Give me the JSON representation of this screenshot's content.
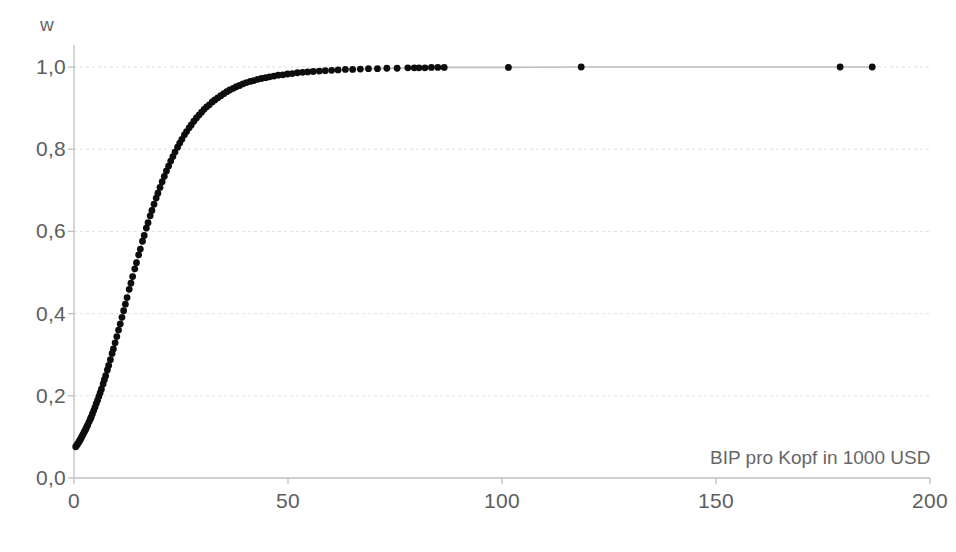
{
  "chart_data": {
    "type": "scatter",
    "title": "",
    "subtitle": "",
    "xlabel": "BIP pro Kopf in 1000 USD",
    "ylabel": "w",
    "xlim": [
      0,
      200
    ],
    "ylim": [
      0,
      1.05
    ],
    "xticks": [
      0,
      50,
      100,
      150,
      200
    ],
    "xtick_labels": [
      "0",
      "50",
      "100",
      "150",
      "200"
    ],
    "yticks": [
      0.0,
      0.2,
      0.4,
      0.6,
      0.8,
      1.0
    ],
    "ytick_labels": [
      "0,0",
      "0,2",
      "0,4",
      "0,6",
      "0,8",
      "1,0"
    ],
    "grid": "horizontal",
    "legend": "none",
    "marker_color": "#0d0d0d",
    "line_color": "#bfbfbf",
    "grid_color": "#e0e0e0",
    "axis_color": "#bfbfbf",
    "series": [
      {
        "name": "w",
        "x": [
          0.4,
          0.6,
          0.8,
          1.0,
          1.2,
          1.4,
          1.6,
          1.8,
          2.0,
          2.2,
          2.4,
          2.6,
          2.8,
          3.0,
          3.2,
          3.5,
          3.8,
          4.0,
          4.3,
          4.6,
          4.9,
          5.2,
          5.5,
          5.8,
          6.1,
          6.4,
          6.8,
          7.1,
          7.4,
          7.8,
          8.1,
          8.5,
          8.9,
          9.2,
          9.6,
          10.0,
          10.4,
          10.8,
          11.2,
          11.6,
          12.0,
          12.4,
          12.9,
          13.3,
          13.7,
          14.2,
          14.6,
          15.1,
          15.5,
          16.0,
          16.4,
          16.9,
          17.3,
          17.8,
          18.2,
          18.7,
          19.2,
          19.6,
          20.1,
          20.6,
          21.1,
          21.6,
          22.1,
          22.6,
          23.1,
          23.6,
          24.2,
          24.7,
          25.2,
          25.8,
          26.3,
          26.9,
          27.4,
          28.0,
          28.6,
          29.2,
          29.8,
          30.4,
          31.0,
          31.6,
          32.3,
          32.9,
          33.6,
          34.3,
          35.0,
          35.7,
          36.4,
          37.2,
          37.9,
          38.7,
          39.5,
          40.3,
          41.2,
          42.0,
          42.9,
          43.8,
          44.8,
          45.7,
          46.7,
          47.7,
          48.8,
          49.9,
          51.0,
          52.2,
          53.4,
          54.6,
          55.9,
          57.3,
          58.7,
          60.2,
          61.7,
          63.4,
          65.1,
          66.9,
          68.8,
          70.9,
          73.1,
          75.5,
          78.0,
          79.5,
          80.6,
          82.0,
          83.5,
          85.0,
          86.5,
          101.5,
          118.5,
          179.0,
          186.5
        ],
        "y": [
          0.076,
          0.079,
          0.082,
          0.085,
          0.089,
          0.092,
          0.096,
          0.1,
          0.104,
          0.108,
          0.112,
          0.116,
          0.12,
          0.125,
          0.129,
          0.136,
          0.143,
          0.148,
          0.156,
          0.164,
          0.172,
          0.181,
          0.189,
          0.198,
          0.207,
          0.216,
          0.229,
          0.239,
          0.249,
          0.263,
          0.274,
          0.288,
          0.303,
          0.314,
          0.329,
          0.344,
          0.36,
          0.375,
          0.391,
          0.407,
          0.423,
          0.439,
          0.459,
          0.474,
          0.49,
          0.509,
          0.524,
          0.543,
          0.557,
          0.576,
          0.59,
          0.608,
          0.621,
          0.638,
          0.651,
          0.666,
          0.681,
          0.693,
          0.707,
          0.721,
          0.734,
          0.747,
          0.759,
          0.771,
          0.782,
          0.793,
          0.805,
          0.815,
          0.824,
          0.835,
          0.843,
          0.852,
          0.859,
          0.868,
          0.876,
          0.883,
          0.89,
          0.897,
          0.903,
          0.908,
          0.915,
          0.92,
          0.925,
          0.93,
          0.935,
          0.94,
          0.944,
          0.948,
          0.952,
          0.955,
          0.959,
          0.962,
          0.965,
          0.967,
          0.97,
          0.972,
          0.974,
          0.976,
          0.978,
          0.98,
          0.981,
          0.983,
          0.984,
          0.986,
          0.987,
          0.988,
          0.989,
          0.99,
          0.991,
          0.992,
          0.993,
          0.994,
          0.994,
          0.995,
          0.996,
          0.996,
          0.997,
          0.997,
          0.998,
          0.998,
          0.998,
          0.998,
          0.999,
          0.999,
          0.999,
          0.999,
          1.0,
          1.0,
          1.0
        ]
      }
    ]
  }
}
